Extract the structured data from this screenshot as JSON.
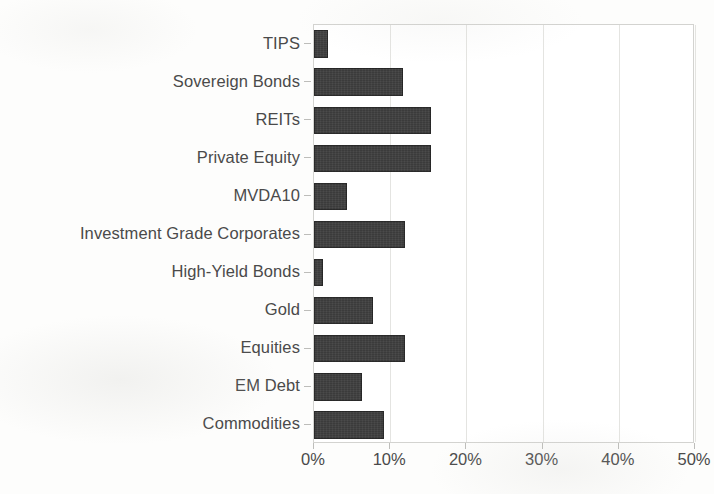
{
  "chart_data": {
    "type": "bar",
    "orientation": "horizontal",
    "title": "",
    "subtitle": "",
    "xlabel": "",
    "ylabel": "",
    "categories": [
      "TIPS",
      "Sovereign Bonds",
      "REITs",
      "Private Equity",
      "MVDA10",
      "Investment Grade Corporates",
      "High-Yield Bonds",
      "Gold",
      "Equities",
      "EM Debt",
      "Commodities"
    ],
    "values": [
      1.8,
      11.7,
      15.3,
      15.3,
      4.3,
      12.0,
      1.2,
      7.8,
      11.9,
      6.3,
      9.2
    ],
    "value_unit": "%",
    "xlim": [
      0,
      50
    ],
    "xticks": [
      0,
      10,
      20,
      30,
      40,
      50
    ],
    "xtick_labels": [
      "0%",
      "10%",
      "20%",
      "30%",
      "40%",
      "50%"
    ],
    "grid": "vertical",
    "legend": "none",
    "bar_color": "#3b3b3b",
    "axis_color": "#d3d3d0",
    "grid_color": "#e4e4e1",
    "label_color": "#4a4a4a",
    "background_color": "#fdfdfc"
  }
}
